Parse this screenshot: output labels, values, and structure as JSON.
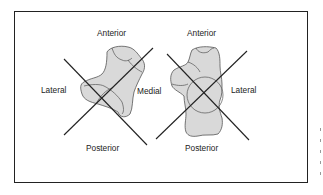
{
  "figure": {
    "left_foot": {
      "labels": {
        "top": "Anterior",
        "left": "Lateral",
        "right": "Medial",
        "bottom": "Posterior"
      }
    },
    "right_foot": {
      "labels": {
        "top": "Anterior",
        "right": "Lateral",
        "bottom": "Posterior"
      }
    },
    "colors": {
      "bone_fill": "#d9d9d9",
      "outline": "#555555",
      "line": "#222222",
      "frame": "#222222"
    }
  }
}
